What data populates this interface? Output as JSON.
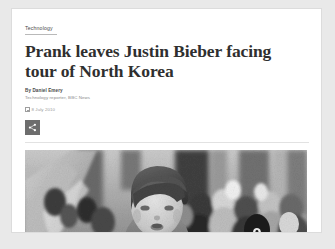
{
  "article": {
    "category": "Technology",
    "headline": "Prank leaves Justin Bieber facing tour of North Korea",
    "author": "By Daniel Emery",
    "author_role": "Technology reporter, BBC News",
    "date": "8 July 2010",
    "share_label": "Share",
    "icons": {
      "date": "calendar-icon",
      "share": "share-icon"
    },
    "photo": {
      "alt": "Black and white photo of Justin Bieber in front of a crowd",
      "caption": ""
    }
  },
  "colors": {
    "page_background": "#e9e9e9",
    "card_background": "#ffffff",
    "card_border": "#dcdcdc",
    "headline_text": "#2f2f2f",
    "muted_text": "#8b8b8b",
    "share_button_background": "#6d6d6d",
    "divider": "#e2e2e2"
  }
}
